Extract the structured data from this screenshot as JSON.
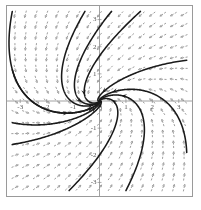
{
  "figure": {
    "title": "",
    "background_color": "#ffffff",
    "frame_color": "#9a9a9a",
    "axis_color": "#8a8a8a",
    "field_color": "#8c8c8c",
    "trajectory_color": "#1a1a1a"
  },
  "chart_data": {
    "type": "scatter",
    "title": "",
    "xlabel": "x",
    "ylabel": "y",
    "xlim": [
      -3.5,
      3.5
    ],
    "ylim": [
      -3.5,
      3.5
    ],
    "grid": false,
    "legend": "none",
    "xticks": [
      -3,
      -2,
      -1,
      1,
      2,
      3
    ],
    "xtick_labels": [
      "-3",
      "-2",
      "-1",
      "1",
      "2",
      "3"
    ],
    "yticks": [
      -3,
      -2,
      -1,
      1,
      2,
      3
    ],
    "ytick_labels": [
      "-3",
      "-2",
      "-1",
      "1",
      "2",
      "3"
    ],
    "field": {
      "kind": "direction-field",
      "arrow_style": "dashed-short",
      "grid_nx": 17,
      "grid_ny": 17,
      "sample_min": -3.2,
      "sample_max": 3.2,
      "a11": -1.0,
      "a12": -1.6,
      "a21": 0.8,
      "a22": -2.2
    },
    "trajectories": [
      {
        "name": "traj-upper-left-in",
        "x0": -3.3,
        "y0": 3.3,
        "direction": "forward",
        "arrow_t": 0.3
      },
      {
        "name": "traj-left-mid",
        "x0": -3.3,
        "y0": 1.15,
        "direction": "forward",
        "arrow_t": 0.45
      },
      {
        "name": "traj-left-low",
        "x0": -3.3,
        "y0": -0.8,
        "direction": "forward",
        "arrow_t": 0.4
      },
      {
        "name": "traj-top-steep",
        "x0": -0.55,
        "y0": 3.3,
        "direction": "forward",
        "arrow_t": 0.55
      },
      {
        "name": "traj-top-right-a",
        "x0": 0.45,
        "y0": 3.3,
        "direction": "forward",
        "arrow_t": 0.35
      },
      {
        "name": "traj-top-right-b",
        "x0": 1.55,
        "y0": 3.3,
        "direction": "forward",
        "arrow_t": 0.3
      },
      {
        "name": "traj-right-upper",
        "x0": 3.3,
        "y0": 1.5,
        "direction": "forward",
        "arrow_t": 0.35
      },
      {
        "name": "traj-right-low",
        "x0": 3.3,
        "y0": -1.9,
        "direction": "forward",
        "arrow_t": 0.4
      },
      {
        "name": "traj-bottom-right",
        "x0": 1.0,
        "y0": -3.3,
        "direction": "forward",
        "arrow_t": 0.35
      },
      {
        "name": "traj-bottom-left",
        "x0": -1.15,
        "y0": -3.3,
        "direction": "forward",
        "arrow_t": 0.4
      },
      {
        "name": "traj-low-left-loop",
        "x0": -3.3,
        "y0": -1.6,
        "direction": "forward",
        "arrow_t": 0.5
      }
    ]
  }
}
